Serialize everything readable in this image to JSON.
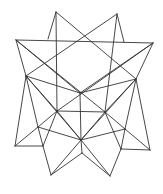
{
  "figure": {
    "stroke_color": "#333333",
    "background": "#ffffff",
    "vertices": {
      "A": [
        56,
        12
      ],
      "B": [
        117,
        14
      ],
      "L": [
        16,
        40
      ],
      "R": [
        153,
        43
      ],
      "P1": [
        48,
        39
      ],
      "P2": [
        124,
        42
      ],
      "LM": [
        26,
        76
      ],
      "RM": [
        136,
        79
      ],
      "C": [
        80,
        93
      ],
      "IL": [
        57,
        111
      ],
      "IR": [
        105,
        112
      ],
      "LL": [
        38,
        127
      ],
      "LR": [
        125,
        129
      ],
      "LF": [
        15,
        146
      ],
      "LF2": [
        43,
        146
      ],
      "RF": [
        150,
        150
      ],
      "RF2": [
        121,
        149
      ],
      "M": [
        81,
        140
      ],
      "M2": [
        82,
        153
      ],
      "BL": [
        51,
        175
      ],
      "BR": [
        110,
        176
      ]
    },
    "edges": [
      [
        "A",
        "P1"
      ],
      [
        "A",
        "RM"
      ],
      [
        "A",
        "IL"
      ],
      [
        "B",
        "P2"
      ],
      [
        "B",
        "LM"
      ],
      [
        "B",
        "IR"
      ],
      [
        "L",
        "R"
      ],
      [
        "L",
        "LM"
      ],
      [
        "L",
        "IR"
      ],
      [
        "L",
        "C"
      ],
      [
        "R",
        "RM"
      ],
      [
        "R",
        "IL"
      ],
      [
        "R",
        "C"
      ],
      [
        "LM",
        "C"
      ],
      [
        "RM",
        "C"
      ],
      [
        "LM",
        "IL"
      ],
      [
        "RM",
        "IR"
      ],
      [
        "LM",
        "LL"
      ],
      [
        "LM",
        "LF"
      ],
      [
        "LM",
        "M"
      ],
      [
        "RM",
        "LR"
      ],
      [
        "RM",
        "RF"
      ],
      [
        "RM",
        "M"
      ],
      [
        "C",
        "M"
      ],
      [
        "IL",
        "IR"
      ],
      [
        "IL",
        "LL"
      ],
      [
        "IL",
        "M"
      ],
      [
        "IL",
        "LF2"
      ],
      [
        "IR",
        "LR"
      ],
      [
        "IR",
        "M"
      ],
      [
        "IR",
        "RF2"
      ],
      [
        "LL",
        "LF"
      ],
      [
        "LL",
        "LF2"
      ],
      [
        "LL",
        "M"
      ],
      [
        "LR",
        "RF"
      ],
      [
        "LR",
        "RF2"
      ],
      [
        "LR",
        "M"
      ],
      [
        "LF",
        "LF2"
      ],
      [
        "RF",
        "RF2"
      ],
      [
        "LF2",
        "BL"
      ],
      [
        "RF2",
        "BR"
      ],
      [
        "M",
        "M2"
      ],
      [
        "M",
        "BL"
      ],
      [
        "M",
        "BR"
      ],
      [
        "M2",
        "BL"
      ],
      [
        "M2",
        "BR"
      ]
    ]
  }
}
